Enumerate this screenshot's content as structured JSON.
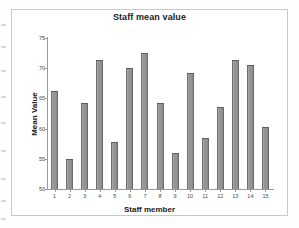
{
  "figure": {
    "title": "Staff mean value",
    "colors": {
      "bar_fill": "#949494",
      "bar_edge": "#6b6b6b",
      "axis": "#9a9a9a",
      "text": "#1b1b1b"
    }
  },
  "chart_data": {
    "type": "bar",
    "title": "Staff mean value",
    "xlabel": "Staff member",
    "ylabel": "Mean Value",
    "categories": [
      "1",
      "2",
      "3",
      "4",
      "5",
      "6",
      "7",
      "8",
      "9",
      "10",
      "11",
      "12",
      "13",
      "14",
      "15"
    ],
    "values": [
      66.2,
      55.0,
      64.2,
      71.3,
      57.8,
      70.1,
      72.5,
      64.2,
      56.0,
      69.2,
      58.5,
      63.5,
      71.3,
      70.5,
      60.2
    ],
    "ylim": [
      50,
      75
    ],
    "yticks": [
      50,
      55,
      60,
      65,
      70,
      75
    ],
    "ytick_labels": [
      "50",
      "55",
      "60",
      "65",
      "70",
      "75"
    ],
    "grid": false,
    "legend": false,
    "legend_position": "none"
  }
}
